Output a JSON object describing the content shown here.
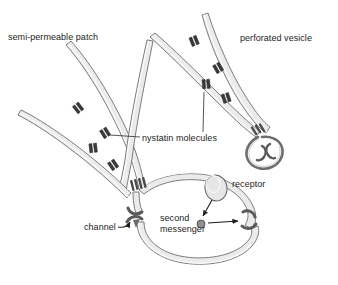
{
  "figure": {
    "title_text_elements": {
      "semi_permeable_patch": "semi-permeable patch",
      "perforated_vesicle": "perforated vesicle",
      "nystatin_molecules": "nystatin molecules",
      "receptor": "receptor",
      "second_messenger": "second\nmessenger",
      "channel": "channel"
    },
    "colors": {
      "background": "#ffffff",
      "membrane_fill": "#e9e9e9",
      "membrane_fill_light": "#f2f2f2",
      "membrane_stroke": "#6e6e6e",
      "molecule_fill": "#3a3a3a",
      "molecule_stroke": "#2a2a2a",
      "channel_fill": "#5a5a5a",
      "receptor_fill": "#e4e4e4",
      "messenger_fill": "#8a8a8a",
      "text": "#1c1c1c",
      "leader_line": "#2b2b2b",
      "arrow": "#1c1c1c"
    },
    "shapes": {
      "membrane_tubes": [
        {
          "name": "patch-membrane-left",
          "desc": "long curved membrane tube sweeping from upper-left down to the cell junction"
        },
        {
          "name": "patch-membrane-right",
          "desc": "long curved membrane tube from top-center down to the cell junction"
        },
        {
          "name": "vesicle-membrane-left",
          "desc": "curved membrane tube from upper-center down to the perforated vesicle"
        },
        {
          "name": "vesicle-membrane-right",
          "desc": "curved membrane tube from top-right down to the perforated vesicle"
        },
        {
          "name": "cell-body-membrane",
          "desc": "large rounded cell outline at lower-center-right"
        },
        {
          "name": "cell-bottom-loop",
          "desc": "U-shaped membrane loop along the bottom of the cell"
        }
      ],
      "nystatin_pairs": [
        {
          "id": 1,
          "x": 78,
          "y": 108,
          "angle": -38
        },
        {
          "id": 2,
          "x": 105,
          "y": 133,
          "angle": -32
        },
        {
          "id": 3,
          "x": 93,
          "y": 148,
          "angle": -6
        },
        {
          "id": 4,
          "x": 113,
          "y": 165,
          "angle": -34
        },
        {
          "id": 5,
          "x": 194,
          "y": 41,
          "angle": -22
        },
        {
          "id": 6,
          "x": 218,
          "y": 68,
          "angle": -30
        },
        {
          "id": 7,
          "x": 206,
          "y": 84,
          "angle": -5
        },
        {
          "id": 8,
          "x": 226,
          "y": 98,
          "angle": -18
        }
      ],
      "channels": [
        {
          "name": "patch-junction-channel",
          "x": 139,
          "y": 188
        },
        {
          "name": "vesicle-neck-channel",
          "x": 259,
          "y": 133
        },
        {
          "name": "cell-channel-left",
          "x": 136,
          "y": 213
        },
        {
          "name": "cell-channel-right",
          "x": 249,
          "y": 219
        }
      ],
      "receptor": {
        "cx": 216,
        "cy": 188,
        "rx": 11,
        "ry": 13
      },
      "second_messenger_dot": {
        "cx": 201,
        "cy": 224,
        "r": 4
      }
    },
    "leader_lines": [
      {
        "from": "nystatin-label-left",
        "to": "nystatin-pair-2"
      },
      {
        "from": "nystatin-label-top",
        "to": "nystatin-pair-7"
      }
    ],
    "arrows": [
      {
        "name": "receptor-to-messenger-arrow",
        "desc": "arrow from receptor down-left to second messenger dot"
      },
      {
        "name": "messenger-to-channel-arrow",
        "desc": "horizontal arrow from second messenger right to the cell channel"
      },
      {
        "name": "channel-label-arrow",
        "desc": "arrow from channel label to the left cell channel"
      },
      {
        "name": "bottom-loop-arrow",
        "desc": "arrowhead on bottom loop pointing up at left cell channel"
      }
    ]
  },
  "labels": {
    "semi_permeable_patch": {
      "text": "semi-permeable patch",
      "x": 8,
      "y": 32
    },
    "perforated_vesicle": {
      "text": "perforated vesicle",
      "x": 240,
      "y": 33
    },
    "nystatin_molecules": {
      "text": "nystatin molecules",
      "x": 142,
      "y": 138
    },
    "receptor": {
      "text": "receptor",
      "x": 232,
      "y": 179
    },
    "second_messenger_line1": {
      "text": "second",
      "x": 160,
      "y": 218
    },
    "second_messenger_line2": {
      "text": "messenger",
      "x": 160,
      "y": 229
    },
    "channel": {
      "text": "channel",
      "x": 86,
      "y": 227
    }
  }
}
